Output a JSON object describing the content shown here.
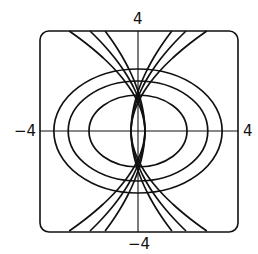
{
  "figure": {
    "type": "orthogonal-trajectories",
    "axis_labels": {
      "top": "4",
      "bottom": "−4",
      "left": "−4",
      "right": "4"
    },
    "window": {
      "xmin": -4,
      "xmax": 4,
      "ymin": -4,
      "ymax": 4
    },
    "ellipses": [
      {
        "rx": 1.98,
        "ry": 1.44
      },
      {
        "rx": 2.82,
        "ry": 2.0
      },
      {
        "rx": 3.4,
        "ry": 2.48
      }
    ],
    "trajectory_top_x": [
      -2.78,
      -1.94,
      -1.33,
      1.37,
      1.94,
      2.78
    ],
    "stroke_color": "#111111"
  }
}
